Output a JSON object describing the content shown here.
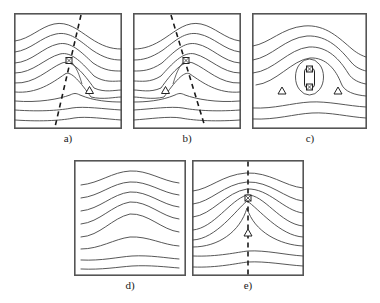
{
  "figure": {
    "title": "",
    "background_color": "#ffffff",
    "panel_count": 5,
    "layout": "3 panels top row, 2 panels bottom row"
  },
  "style": {
    "frame_color": "#555555",
    "contour_color": "#444444",
    "dashed_color": "#1a1a1a",
    "marker_color": "#222222",
    "frame_width": 1.6,
    "contour_width": 0.9,
    "dashed_width": 1.6
  },
  "panels": [
    {
      "id": "a",
      "label": "a)",
      "has_dashed_line": true,
      "dashed_line": {
        "x1": 0.62,
        "y1": 0.02,
        "x2": 0.38,
        "y2": 0.98,
        "orientation": "upper-right to lower-left"
      },
      "markers": [
        {
          "type": "square",
          "name": "peak-square-marker",
          "x": 0.52,
          "y": 0.41
        },
        {
          "type": "triangle",
          "name": "triangle-marker",
          "x": 0.7,
          "y": 0.68
        }
      ],
      "leader_line": {
        "from_x": 0.52,
        "from_y": 0.44,
        "to_x": 0.7,
        "to_y": 0.655
      },
      "contour_type": "ridge-arches"
    },
    {
      "id": "b",
      "label": "b)",
      "has_dashed_line": true,
      "dashed_line": {
        "x1": 0.36,
        "y1": 0.02,
        "x2": 0.66,
        "y2": 0.98,
        "orientation": "upper-left to lower-right"
      },
      "markers": [
        {
          "type": "square",
          "name": "peak-square-marker",
          "x": 0.5,
          "y": 0.41
        },
        {
          "type": "triangle",
          "name": "triangle-marker",
          "x": 0.28,
          "y": 0.68
        }
      ],
      "leader_line": {
        "from_x": 0.5,
        "from_y": 0.44,
        "to_x": 0.28,
        "to_y": 0.655
      },
      "contour_type": "ridge-arches"
    },
    {
      "id": "c",
      "label": "c)",
      "has_dashed_line": false,
      "dashed_line": null,
      "markers": [
        {
          "type": "square",
          "name": "capsule-top-square-marker",
          "x": 0.5,
          "y": 0.47
        },
        {
          "type": "square",
          "name": "capsule-bottom-square-marker",
          "x": 0.5,
          "y": 0.64
        },
        {
          "type": "triangle",
          "name": "triangle-marker-left",
          "x": 0.26,
          "y": 0.7
        },
        {
          "type": "triangle",
          "name": "triangle-marker-right",
          "x": 0.74,
          "y": 0.7
        }
      ],
      "capsule": {
        "x": 0.5,
        "y": 0.555,
        "rx": 0.055,
        "ry": 0.105
      },
      "contour_type": "closed-oval-nest"
    },
    {
      "id": "d",
      "label": "d)",
      "has_dashed_line": false,
      "dashed_line": null,
      "markers": [],
      "contour_type": "smooth-broad-hump"
    },
    {
      "id": "e",
      "label": "e)",
      "has_dashed_line": true,
      "dashed_line": {
        "x1": 0.5,
        "y1": 0.0,
        "x2": 0.5,
        "y2": 1.0,
        "orientation": "vertical"
      },
      "markers": [
        {
          "type": "square",
          "name": "peak-square-marker",
          "x": 0.5,
          "y": 0.33
        },
        {
          "type": "triangle",
          "name": "triangle-marker",
          "x": 0.5,
          "y": 0.63
        }
      ],
      "contour_type": "narrow-spike-ridge"
    }
  ],
  "labels": {
    "a": "a)",
    "b": "b)",
    "c": "c)",
    "d": "d)",
    "e": "e)"
  }
}
